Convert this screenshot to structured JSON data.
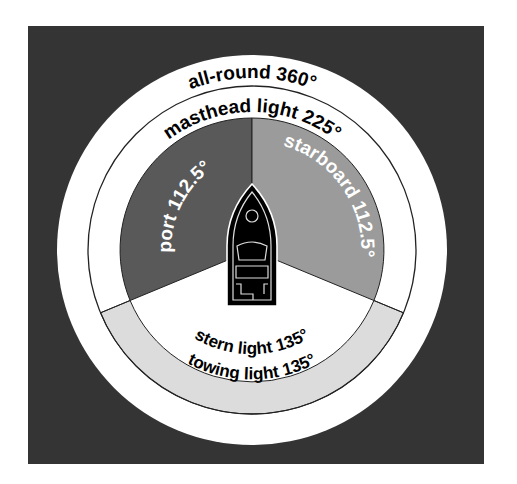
{
  "diagram": {
    "colors": {
      "background": "#343434",
      "ring_white": "#ffffff",
      "port_sector": "#595959",
      "starboard_sector": "#9b9b9b",
      "towing_band": "#dcdcdc",
      "stroke": "#222222",
      "boat": "#000000"
    },
    "labels": {
      "all_round": "all-round 360°",
      "masthead": "masthead light 225°",
      "port": "port 112.5°",
      "starboard": "starboard 112.5°",
      "stern": "stern light 135°",
      "towing": "towing light 135°"
    },
    "arcs": [
      {
        "name": "all-round",
        "degrees": 360
      },
      {
        "name": "masthead light",
        "degrees": 225
      },
      {
        "name": "port",
        "degrees": 112.5
      },
      {
        "name": "starboard",
        "degrees": 112.5
      },
      {
        "name": "stern light",
        "degrees": 135
      },
      {
        "name": "towing light",
        "degrees": 135
      }
    ]
  }
}
